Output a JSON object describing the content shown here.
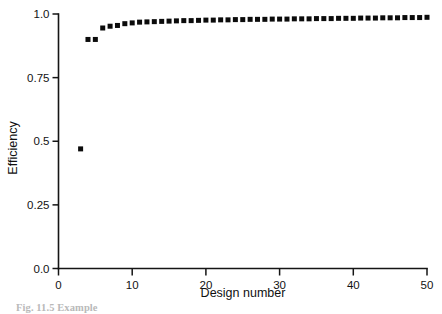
{
  "figure": {
    "background_color": "#ffffff",
    "ink_color": "#0b0b0b",
    "caption_partial": "Fig. 11.5  Example"
  },
  "chart_data": {
    "type": "scatter",
    "title": "",
    "xlabel": "Design number",
    "ylabel": "Efficiency",
    "xlim": [
      0,
      50
    ],
    "ylim": [
      0.0,
      1.0
    ],
    "grid": false,
    "legend": "none",
    "marker": "square",
    "marker_color": "#0b0b0b",
    "marker_size_px": 5,
    "xticks": [
      0,
      10,
      20,
      30,
      40,
      50
    ],
    "xtick_labels": [
      "0",
      "10",
      "20",
      "30",
      "40",
      "50"
    ],
    "yticks": [
      0.0,
      0.25,
      0.5,
      0.75,
      1.0
    ],
    "ytick_labels": [
      "0.0",
      "0.25",
      "0.5",
      "0.75",
      "1.0"
    ],
    "x": [
      3,
      4,
      5,
      6,
      7,
      8,
      9,
      10,
      11,
      12,
      13,
      14,
      15,
      16,
      17,
      18,
      19,
      20,
      21,
      22,
      23,
      24,
      25,
      26,
      27,
      28,
      29,
      30,
      31,
      32,
      33,
      34,
      35,
      36,
      37,
      38,
      39,
      40,
      41,
      42,
      43,
      44,
      45,
      46,
      47,
      48,
      49,
      50
    ],
    "y": [
      0.47,
      0.9,
      0.9,
      0.945,
      0.952,
      0.955,
      0.962,
      0.965,
      0.968,
      0.969,
      0.97,
      0.971,
      0.972,
      0.973,
      0.974,
      0.974,
      0.975,
      0.976,
      0.976,
      0.977,
      0.977,
      0.978,
      0.978,
      0.979,
      0.979,
      0.979,
      0.98,
      0.98,
      0.98,
      0.981,
      0.981,
      0.981,
      0.982,
      0.982,
      0.982,
      0.983,
      0.983,
      0.983,
      0.984,
      0.984,
      0.984,
      0.985,
      0.985,
      0.985,
      0.986,
      0.986,
      0.986,
      0.987
    ]
  }
}
